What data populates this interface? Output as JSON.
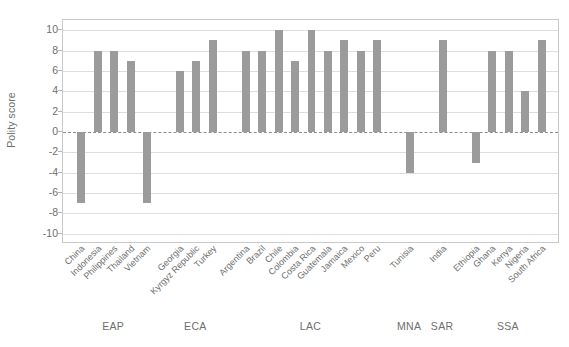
{
  "chart_data": {
    "type": "bar",
    "title": "",
    "subtitle": "",
    "xlabel": "",
    "ylabel": "Polity score",
    "ylim": [
      -11,
      11
    ],
    "yticks": [
      10,
      8,
      6,
      4,
      2,
      0,
      -2,
      -4,
      -6,
      -8,
      -10
    ],
    "ytick_labels": [
      "10",
      "8",
      "6",
      "4",
      "2",
      "0",
      "-2",
      "-4",
      "-6",
      "-8",
      "-10"
    ],
    "grid": true,
    "grid_axis": "y",
    "zero_line": true,
    "legend": "none",
    "bar_color": "#9b9b9b",
    "categories": [
      "China",
      "Indonesia",
      "Philippines",
      "Thailand",
      "Vietnam",
      "Georgia",
      "Kyrgyz Republic",
      "Turkey",
      "Argentina",
      "Brazil",
      "Chile",
      "Colombia",
      "Costa Rica",
      "Guatemala",
      "Jamaica",
      "Mexico",
      "Peru",
      "Tunisia",
      "India",
      "Ethiopia",
      "Ghana",
      "Kenya",
      "Nigeria",
      "South Africa"
    ],
    "values": [
      -7,
      8,
      8,
      7,
      -7,
      6,
      7,
      9,
      8,
      8,
      10,
      7,
      10,
      8,
      9,
      8,
      9,
      -4,
      9,
      -3,
      8,
      8,
      4,
      9
    ],
    "groups": [
      {
        "label": "EAP",
        "start": 0,
        "end": 4
      },
      {
        "label": "ECA",
        "start": 5,
        "end": 7
      },
      {
        "label": "LAC",
        "start": 8,
        "end": 16
      },
      {
        "label": "MNA",
        "start": 17,
        "end": 17
      },
      {
        "label": "SAR",
        "start": 18,
        "end": 18
      },
      {
        "label": "SSA",
        "start": 19,
        "end": 23
      }
    ]
  }
}
